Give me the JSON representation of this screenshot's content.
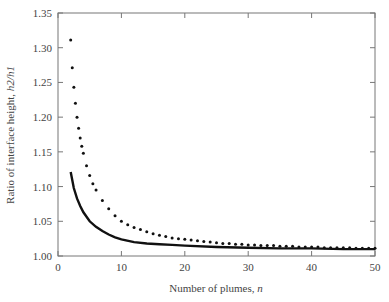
{
  "chart_data": {
    "type": "line",
    "title": "",
    "xlabel": "Number of plumes, n",
    "ylabel": "Ratio of interface height, h2/h1",
    "xlim": [
      0,
      50
    ],
    "ylim": [
      1.0,
      1.35
    ],
    "xticks": [
      "0",
      "10",
      "20",
      "30",
      "40",
      "50"
    ],
    "yticks": [
      "1.00",
      "1.05",
      "1.10",
      "1.15",
      "1.20",
      "1.25",
      "1.30",
      "1.35"
    ],
    "grid": false,
    "legend": null,
    "series": [
      {
        "name": "dotted curve",
        "style": "dotted",
        "x": [
          2,
          2.25,
          2.5,
          2.75,
          3,
          3.25,
          3.5,
          3.75,
          4,
          4.5,
          5,
          5.5,
          6,
          7,
          8,
          9,
          10,
          11,
          12,
          13,
          14,
          15,
          16,
          17,
          18,
          19,
          20,
          21,
          22,
          23,
          24,
          25,
          26,
          27,
          28,
          29,
          30,
          31,
          32,
          33,
          34,
          35,
          36,
          37,
          38,
          39,
          40,
          41,
          42,
          43,
          44,
          45,
          46,
          47,
          48,
          49,
          50
        ],
        "values": [
          1.311,
          1.271,
          1.243,
          1.22,
          1.2,
          1.184,
          1.17,
          1.158,
          1.148,
          1.13,
          1.116,
          1.104,
          1.095,
          1.08,
          1.068,
          1.058,
          1.05,
          1.045,
          1.041,
          1.038,
          1.035,
          1.032,
          1.03,
          1.028,
          1.026,
          1.025,
          1.024,
          1.023,
          1.022,
          1.021,
          1.02,
          1.019,
          1.018,
          1.018,
          1.017,
          1.017,
          1.016,
          1.016,
          1.015,
          1.015,
          1.015,
          1.014,
          1.014,
          1.014,
          1.013,
          1.013,
          1.013,
          1.013,
          1.012,
          1.012,
          1.012,
          1.012,
          1.012,
          1.011,
          1.011,
          1.011,
          1.011
        ]
      },
      {
        "name": "solid curve",
        "style": "solid",
        "x": [
          2,
          2.5,
          3,
          3.5,
          4,
          5,
          6,
          7,
          8,
          9,
          10,
          12,
          14,
          16,
          18,
          20,
          25,
          30,
          35,
          40,
          45,
          50
        ],
        "values": [
          1.121,
          1.098,
          1.083,
          1.072,
          1.063,
          1.05,
          1.042,
          1.036,
          1.031,
          1.027,
          1.024,
          1.02,
          1.018,
          1.017,
          1.016,
          1.015,
          1.013,
          1.012,
          1.011,
          1.011,
          1.01,
          1.01
        ]
      }
    ]
  }
}
